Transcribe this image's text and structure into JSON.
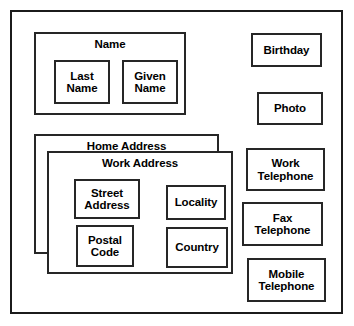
{
  "diagram": {
    "frame": {
      "name": "outer-frame"
    },
    "groups": [
      {
        "id": "name",
        "label": "Name",
        "children": [
          {
            "id": "last-name",
            "label": "Last\nName"
          },
          {
            "id": "given-name",
            "label": "Given\nName"
          }
        ]
      },
      {
        "id": "home-address",
        "label": "Home Address",
        "children": []
      },
      {
        "id": "work-address",
        "label": "Work Address",
        "children": [
          {
            "id": "street-address",
            "label": "Street\nAddress"
          },
          {
            "id": "postal-code",
            "label": "Postal\nCode"
          },
          {
            "id": "locality",
            "label": "Locality"
          },
          {
            "id": "country",
            "label": "Country"
          }
        ]
      }
    ],
    "attributes": [
      {
        "id": "birthday",
        "label": "Birthday"
      },
      {
        "id": "photo",
        "label": "Photo"
      },
      {
        "id": "work-tel",
        "label": "Work\nTelephone"
      },
      {
        "id": "fax-tel",
        "label": "Fax\nTelephone"
      },
      {
        "id": "mobile-tel",
        "label": "Mobile\nTelephone"
      }
    ],
    "colors": {
      "background": "#ffffff",
      "border": "#262626",
      "frame_border": "#1b1b1b",
      "text": "#000000"
    }
  }
}
